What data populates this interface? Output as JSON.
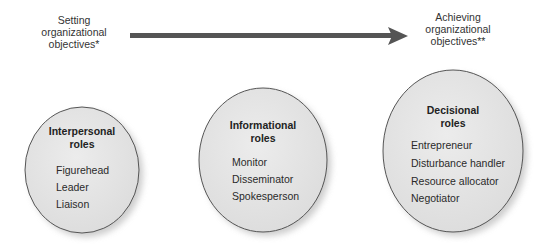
{
  "arrow": {
    "start_label": [
      "Setting",
      "organizational",
      "objectives*"
    ],
    "end_label": [
      "Achieving",
      "organizational",
      "objectives**"
    ],
    "color": "#555555"
  },
  "roles": [
    {
      "title": [
        "Interpersonal",
        "roles"
      ],
      "items": [
        "Figurehead",
        "Leader",
        "Liaison"
      ]
    },
    {
      "title": [
        "Informational",
        "roles"
      ],
      "items": [
        "Monitor",
        "Disseminator",
        "Spokesperson"
      ]
    },
    {
      "title": [
        "Decisional",
        "roles"
      ],
      "items": [
        "Entrepreneur",
        "Disturbance handler",
        "Resource allocator",
        "Negotiator"
      ]
    }
  ],
  "colors": {
    "ellipse_fill": "#e4e4e4",
    "ellipse_stroke": "#555555",
    "shadow": "#bdbdbd"
  }
}
